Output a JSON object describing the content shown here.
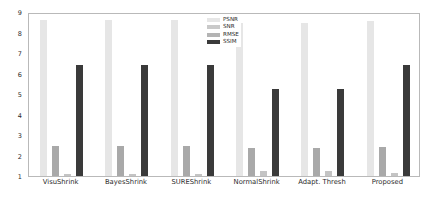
{
  "chart_data": {
    "type": "bar",
    "title": "",
    "xlabel": "",
    "ylabel": "",
    "ylim": [
      1,
      9
    ],
    "yticks": [
      1,
      2,
      3,
      4,
      5,
      6,
      7,
      8,
      9
    ],
    "grid": false,
    "legend_position": "top-right",
    "categories": [
      "VisuShrink",
      "BayesShrink",
      "SUREShrink",
      "NormalShrink",
      "Adapt. Thresh",
      "Proposed"
    ],
    "series": [
      {
        "name": "PSNR",
        "color": "#e6e6e6",
        "values": [
          8.6,
          8.6,
          8.6,
          8.45,
          8.45,
          8.55
        ]
      },
      {
        "name": "SNR",
        "color": "#a9a9a9",
        "values": [
          2.48,
          2.48,
          2.48,
          2.35,
          2.35,
          2.4
        ]
      },
      {
        "name": "RMSE",
        "color": "#c4c4c4",
        "values": [
          1.08,
          1.08,
          1.08,
          1.26,
          1.26,
          1.14
        ]
      },
      {
        "name": "SSIM",
        "color": "#3a3a3a",
        "values": [
          6.4,
          6.4,
          6.4,
          5.25,
          5.25,
          6.42
        ]
      }
    ]
  },
  "legend": {
    "items": [
      {
        "label": "PSNR",
        "color": "#e6e6e6"
      },
      {
        "label": "SNR",
        "color": "#c9c9c9"
      },
      {
        "label": "RMSE",
        "color": "#b4b4b4"
      },
      {
        "label": "SSIM",
        "color": "#3a3a3a"
      }
    ]
  },
  "axes": {
    "y_tick_labels": [
      "9",
      "8",
      "7",
      "6",
      "5",
      "4",
      "3",
      "2",
      "1"
    ],
    "x_tick_labels": [
      "VisuShrink",
      "BayesShrink",
      "SUREShrink",
      "NormalShrink",
      "Adapt. Thresh",
      "Proposed"
    ]
  }
}
